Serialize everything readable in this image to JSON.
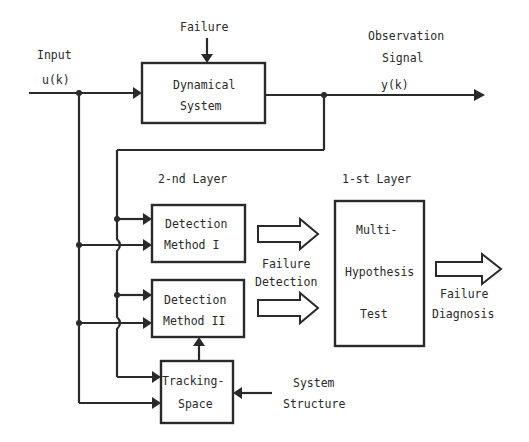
{
  "diagram": {
    "type": "block-diagram",
    "labels": {
      "input": "Input",
      "input_signal": "u(k)",
      "failure": "Failure",
      "observation_line1": "Observation",
      "observation_line2": "Signal",
      "output_signal": "y(k)",
      "second_layer": "2-nd Layer",
      "first_layer": "1-st Layer",
      "failure_detection_line1": "Failure",
      "failure_detection_line2": "Detection",
      "failure_diagnosis_line1": "Failure",
      "failure_diagnosis_line2": "Diagnosis",
      "system_structure_line1": "System",
      "system_structure_line2": "Structure"
    },
    "blocks": {
      "dynamical_system": {
        "line1": "Dynamical",
        "line2": "System"
      },
      "detection_method_1": {
        "line1": "Detection",
        "line2": "Method I"
      },
      "detection_method_2": {
        "line1": "Detection",
        "line2": "Method II"
      },
      "tracking_space": {
        "line1": "Tracking-",
        "line2": "Space"
      },
      "multi_hypothesis_test": {
        "line1": "Multi-",
        "line2": "Hypothesis",
        "line3": "Test"
      }
    },
    "connections": [
      {
        "from": "Input u(k)",
        "to": "Dynamical System"
      },
      {
        "from": "Failure",
        "to": "Dynamical System"
      },
      {
        "from": "Dynamical System",
        "to": "Observation Signal y(k)"
      },
      {
        "from": "u(k)",
        "to": "Detection Method I"
      },
      {
        "from": "y(k)",
        "to": "Detection Method I"
      },
      {
        "from": "u(k)",
        "to": "Detection Method II"
      },
      {
        "from": "y(k)",
        "to": "Detection Method II"
      },
      {
        "from": "u(k)",
        "to": "Tracking-Space"
      },
      {
        "from": "y(k)",
        "to": "Tracking-Space"
      },
      {
        "from": "System Structure",
        "to": "Tracking-Space"
      },
      {
        "from": "Tracking-Space",
        "to": "Detection Method II"
      },
      {
        "from": "Detection Method I",
        "to": "Multi-Hypothesis Test",
        "style": "hollow-arrow"
      },
      {
        "from": "Detection Method II",
        "to": "Multi-Hypothesis Test",
        "style": "hollow-arrow"
      },
      {
        "from": "Multi-Hypothesis Test",
        "to": "Failure Diagnosis",
        "style": "hollow-arrow"
      }
    ]
  }
}
